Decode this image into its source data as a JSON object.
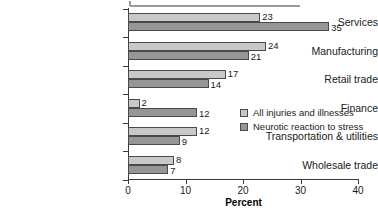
{
  "chart_data": {
    "type": "bar",
    "orientation": "horizontal",
    "title": "",
    "xlabel": "Percent",
    "ylabel": "",
    "xlim": [
      0,
      40
    ],
    "xticks": [
      0,
      10,
      20,
      30,
      40
    ],
    "xtick_labels": [
      "0",
      "10",
      "20",
      "30",
      "40"
    ],
    "grid": false,
    "legend_position": "center-right-inset",
    "categories": [
      "Services",
      "Manufacturing",
      "Retail trade",
      "Finance",
      "Transportation & utilities",
      "Wholesale trade"
    ],
    "series": [
      {
        "name": "All injuries and illnesses",
        "color": "#c8c8c8",
        "values": [
          23,
          24,
          17,
          2,
          12,
          8
        ]
      },
      {
        "name": "Neurotic reaction to stress",
        "color": "#969696",
        "values": [
          35,
          21,
          14,
          12,
          9,
          7
        ]
      }
    ],
    "data_labels": {
      "All injuries and illnesses": [
        "23",
        "24",
        "17",
        "2",
        "12",
        "8"
      ],
      "Neurotic reaction to stress": [
        "35",
        "21",
        "14",
        "12",
        "9",
        "7"
      ]
    }
  },
  "axis": {
    "x_title": "Percent"
  },
  "legend": {
    "items": [
      {
        "label": "All injuries and illnesses",
        "swatch": "light"
      },
      {
        "label": "Neurotic reaction to stress",
        "swatch": "dark"
      }
    ]
  }
}
